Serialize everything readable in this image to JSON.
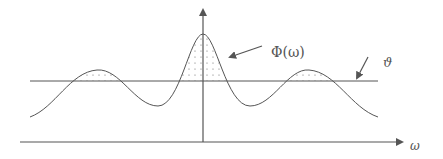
{
  "diagram": {
    "type": "spectral-threshold-diagram",
    "labels": {
      "function": "Φ(ω)",
      "threshold": "ϑ",
      "x_axis": "ω"
    },
    "colors": {
      "stroke": "#555555",
      "axis": "#555555",
      "dots": "#666666",
      "background": "#ffffff"
    },
    "curve": {
      "description": "Central main lobe with two smaller side lobes; regions above threshold are dot-shaded",
      "peaks": [
        "left side lobe",
        "central main lobe",
        "right side lobe"
      ],
      "shaded_regions": "portions of curve above the threshold line ϑ"
    }
  }
}
